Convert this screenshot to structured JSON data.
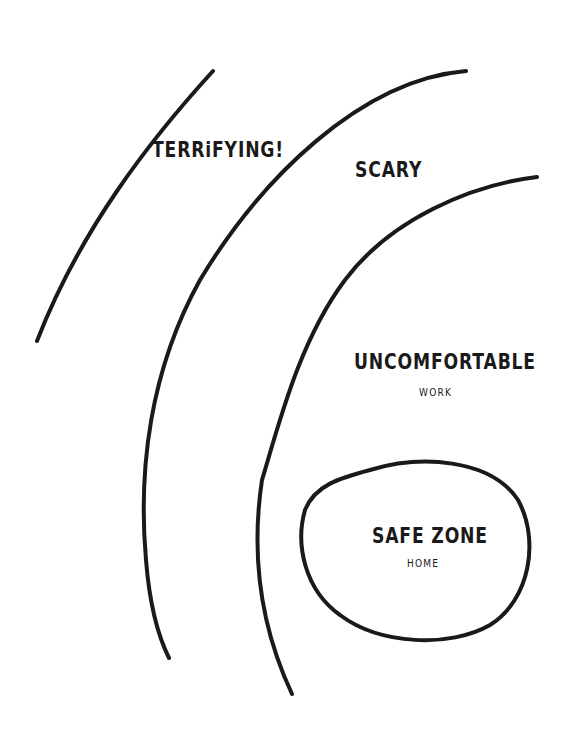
{
  "diagram": {
    "stroke_color": "#1a1a1a",
    "zones": [
      {
        "id": "terrifying",
        "label": "TERRiFYING!"
      },
      {
        "id": "scary",
        "label": "SCARY"
      },
      {
        "id": "uncomfortable",
        "label": "UNCOMFORTABLE",
        "sublabel": "WORK"
      },
      {
        "id": "safe",
        "label": "SAFE ZONE",
        "sublabel": "HOME"
      }
    ]
  }
}
